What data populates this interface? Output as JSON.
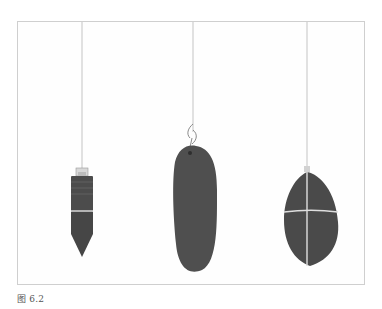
{
  "figure": {
    "caption": "图 6.2",
    "items": [
      {
        "name": "metal-bullet-pendulum",
        "description": "cylindrical metal pendulum with pointed tip"
      },
      {
        "name": "oval-stone-pendulum",
        "description": "elongated oval stone hanging from a hook"
      },
      {
        "name": "wrapped-stone-pendulum",
        "description": "teardrop stone wrapped with cord in a cross pattern"
      }
    ],
    "colors": {
      "stone": "#4a4a4a",
      "string": "#bdbdbd",
      "frame_border": "#cfcfcf"
    }
  }
}
